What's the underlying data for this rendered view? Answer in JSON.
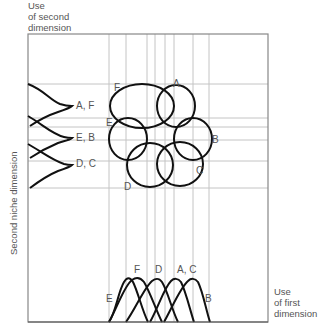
{
  "axes": {
    "y_top_label": [
      "Use",
      "of second",
      "dimension"
    ],
    "x_right_label": [
      "Use",
      "of first",
      "dimension"
    ],
    "y_axis_title": "Second niche dimension"
  },
  "left_curves": {
    "labels": [
      "A, F",
      "E, B",
      "D, C"
    ]
  },
  "ellipses": {
    "labels": [
      "A",
      "B",
      "C",
      "D",
      "E",
      "F"
    ]
  },
  "bottom_curves": {
    "labels": [
      "E",
      "F",
      "D",
      "A, C",
      "B"
    ]
  },
  "colors": {
    "stroke": "#111111",
    "grid": "#bbbbbb",
    "frame": "#888888",
    "text": "#555555"
  }
}
